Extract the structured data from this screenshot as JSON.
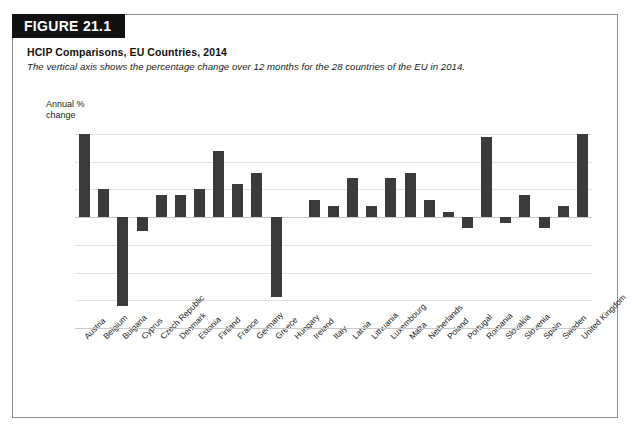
{
  "figure": {
    "banner_label": "FIGURE 21.1",
    "title": "HCIP Comparisons, EU Countries, 2014",
    "subtitle": "The vertical axis shows the percentage change over 12 months for the 28 countries of the EU in 2014."
  },
  "colors": {
    "banner_background": "#111111",
    "banner_text": "#ffffff",
    "bar_fill": "#3b3b3b",
    "gridline": "#e2e2e2",
    "axis_line": "#c9c9c9",
    "card_border": "#8d8d8d"
  },
  "chart_data": {
    "type": "bar",
    "title": "HCIP Comparisons, EU Countries, 2014",
    "subtitle": "The vertical axis shows the percentage change over 12 months for the 28 countries of the EU in 2014.",
    "xlabel": "",
    "ylabel": "Annual %\nchange",
    "ylim": [
      -2.0,
      1.75
    ],
    "yticks": [
      1.5,
      1.0,
      0.5,
      0.0,
      -0.5,
      -1.0,
      -1.5,
      -2.0
    ],
    "ytick_labels": [
      "1.5",
      "1.0",
      "0.5",
      "0.0",
      "-0.5",
      "-1.0",
      "-1.5",
      "-2.0"
    ],
    "grid": true,
    "legend": false,
    "categories": [
      "Austria",
      "Belgium",
      "Bulgaria",
      "Cyprus",
      "Czech Republic",
      "Denmark",
      "Estonia",
      "Finland",
      "France",
      "Germany",
      "Greece",
      "Hungary",
      "Ireland",
      "Italy",
      "Latvia",
      "Lithuania",
      "Luxembourg",
      "Malta",
      "Netherlands",
      "Poland",
      "Portugal",
      "Romania",
      "Slovakia",
      "Slovenia",
      "Spain",
      "Sweden",
      "United Kingdom"
    ],
    "values": [
      1.5,
      0.5,
      -1.6,
      -0.25,
      0.4,
      0.4,
      0.5,
      1.2,
      0.6,
      0.8,
      -1.45,
      0.0,
      0.3,
      0.2,
      0.7,
      0.2,
      0.7,
      0.8,
      0.3,
      0.1,
      -0.2,
      1.45,
      -0.1,
      0.4,
      -0.2,
      0.2,
      1.5
    ]
  }
}
